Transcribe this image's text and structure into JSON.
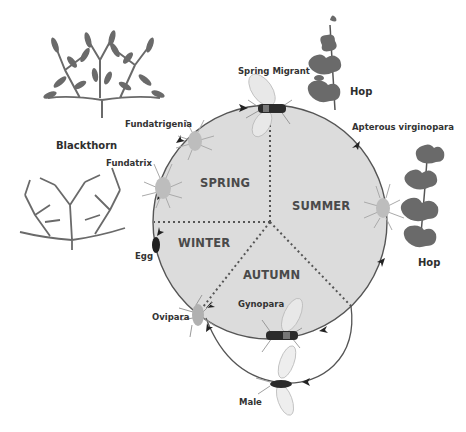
{
  "diagram": {
    "type": "life-cycle",
    "colors": {
      "circle_fill": "#dcdcdc",
      "circle_stroke": "#555555",
      "foliage": "#6a6a6a",
      "text": "#333333",
      "aphid_body": "#b9b9b9",
      "winged_body": "#2b2b2b"
    },
    "seasons": [
      {
        "id": "spring",
        "label": "SPRING"
      },
      {
        "id": "summer",
        "label": "SUMMER"
      },
      {
        "id": "autumn",
        "label": "AUTUMN"
      },
      {
        "id": "winter",
        "label": "WINTER"
      }
    ],
    "hosts": [
      {
        "id": "blackthorn",
        "label": "Blackthorn"
      },
      {
        "id": "hop-top",
        "label": "Hop"
      },
      {
        "id": "hop-right",
        "label": "Hop"
      }
    ],
    "stages": [
      {
        "id": "egg",
        "label": "Egg"
      },
      {
        "id": "fundatrix",
        "label": "Fundatrix"
      },
      {
        "id": "fundatrigenia",
        "label": "Fundatrigenia"
      },
      {
        "id": "spring-migrant",
        "label": "Spring Migrant"
      },
      {
        "id": "apterous-virginopara",
        "label": "Apterous virginopara"
      },
      {
        "id": "gynopara",
        "label": "Gynopara"
      },
      {
        "id": "male",
        "label": "Male"
      },
      {
        "id": "ovipara",
        "label": "Ovipara"
      }
    ],
    "cycle_order": [
      "Egg",
      "Fundatrix",
      "Fundatrigenia",
      "Spring Migrant",
      "Apterous virginopara",
      "Gynopara",
      "Ovipara",
      "Egg"
    ],
    "side_path": [
      "Gynopara",
      "Male",
      "Ovipara"
    ]
  }
}
